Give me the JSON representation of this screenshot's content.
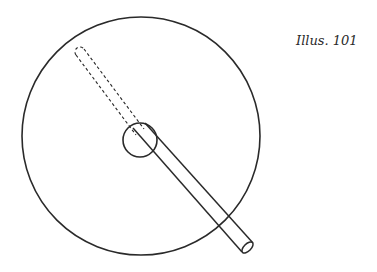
{
  "caption": "Illus. 101",
  "figure": {
    "stroke_color": "#2a2a2a",
    "background": "#ffffff",
    "outer_circle": {
      "cx": 141,
      "cy": 136,
      "r": 119
    },
    "hub_circle": {
      "cx": 140,
      "cy": 140,
      "r": 17
    },
    "rod_solid": {
      "from": [
        140,
        132
      ],
      "to": [
        248,
        246
      ],
      "width": 10
    },
    "rod_dashed": {
      "from": [
        80,
        52
      ],
      "to": [
        140,
        132
      ],
      "width": 10
    }
  }
}
